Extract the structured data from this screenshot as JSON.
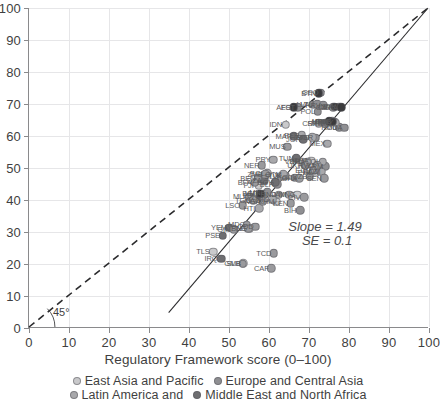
{
  "chart_data": {
    "type": "scatter",
    "title": "",
    "xlabel": "Regulatory Framework score (0–100)",
    "ylabel": "",
    "xlim": [
      0,
      100
    ],
    "ylim": [
      0,
      100
    ],
    "xticks": [
      0,
      10,
      20,
      30,
      40,
      50,
      60,
      70,
      80,
      90,
      100
    ],
    "yticks": [
      0,
      10,
      20,
      30,
      40,
      50,
      60,
      70,
      80,
      90,
      100
    ],
    "grid": true,
    "legend_position": "bottom",
    "annotations": [
      {
        "name": "slope",
        "text": "Slope = 1.49",
        "x": 74,
        "y": 32
      },
      {
        "name": "se",
        "text": "SE = 0.1",
        "x": 74.5,
        "y": 27.5
      },
      {
        "name": "angle",
        "text": "45°",
        "x": 5.5,
        "y": 3.2
      }
    ],
    "reference_lines": [
      {
        "name": "identity-45-degree-line",
        "style": "dashed",
        "x0": 0,
        "y0": 0,
        "x1": 100,
        "y1": 100
      },
      {
        "name": "regression-fit-line",
        "style": "solid",
        "x0": 35,
        "y0": 4.5,
        "x1": 100,
        "y1": 100,
        "slope": 1.49
      }
    ],
    "series": [
      {
        "name": "East Asia and Pacific",
        "color": "#c9c9cb",
        "points": [
          {
            "label": "IDN",
            "x": 64.2,
            "y": 63.5
          },
          {
            "label": "THA",
            "x": 70.5,
            "y": 52.2
          },
          {
            "label": "PHL",
            "x": 71.5,
            "y": 48.5
          },
          {
            "label": "VNM",
            "x": 68.4,
            "y": 52.0
          },
          {
            "label": "MNG",
            "x": 67.0,
            "y": 41.6
          },
          {
            "label": "KHM",
            "x": 61.8,
            "y": 39.4
          },
          {
            "label": "LAO",
            "x": 58.6,
            "y": 40.0
          },
          {
            "label": "FJI",
            "x": 57.4,
            "y": 44.4
          },
          {
            "label": "PNG",
            "x": 55.0,
            "y": 31.0
          },
          {
            "label": "SLB",
            "x": 53.6,
            "y": 20.3
          },
          {
            "label": "TLS",
            "x": 46.0,
            "y": 23.8
          },
          {
            "label": "VUT",
            "x": 58.2,
            "y": 42.0
          }
        ]
      },
      {
        "name": "Europe and Central Asia",
        "color": "#8f8f92",
        "points": [
          {
            "label": "EST",
            "x": 67.2,
            "y": 69.0
          },
          {
            "label": "GEO",
            "x": 72.8,
            "y": 73.5
          },
          {
            "label": "LVA",
            "x": 71.0,
            "y": 69.8
          },
          {
            "label": "LTU",
            "x": 72.0,
            "y": 70.0
          },
          {
            "label": "HRV",
            "x": 73.5,
            "y": 69.6
          },
          {
            "label": "SVK",
            "x": 77.5,
            "y": 69.2
          },
          {
            "label": "CZE",
            "x": 76.0,
            "y": 69.0
          },
          {
            "label": "POL",
            "x": 72.2,
            "y": 67.6
          },
          {
            "label": "SRB",
            "x": 74.0,
            "y": 64.0
          },
          {
            "label": "MKD",
            "x": 75.2,
            "y": 64.2
          },
          {
            "label": "ALB",
            "x": 76.4,
            "y": 64.4
          },
          {
            "label": "ROU",
            "x": 77.6,
            "y": 62.8
          },
          {
            "label": "MDA",
            "x": 78.8,
            "y": 62.6
          },
          {
            "label": "BGR",
            "x": 71.5,
            "y": 59.4
          },
          {
            "label": "ARM",
            "x": 74.0,
            "y": 50.6
          },
          {
            "label": "KAZ",
            "x": 72.8,
            "y": 49.0
          },
          {
            "label": "UZB",
            "x": 70.2,
            "y": 47.3
          },
          {
            "label": "KGZ",
            "x": 66.4,
            "y": 47.0
          },
          {
            "label": "TJK",
            "x": 64.0,
            "y": 47.6
          },
          {
            "label": "BIH",
            "x": 67.8,
            "y": 36.8
          },
          {
            "label": "UKR",
            "x": 69.0,
            "y": 50.8
          },
          {
            "label": "BLR",
            "x": 62.0,
            "y": 45.0
          },
          {
            "label": "MNE",
            "x": 59.6,
            "y": 42.4
          }
        ]
      },
      {
        "name": "Latin America and the Caribbean",
        "color": "#a8a8ab",
        "points": [
          {
            "label": "CRI",
            "x": 72.4,
            "y": 64.0
          },
          {
            "label": "CHL",
            "x": 75.8,
            "y": 64.6
          },
          {
            "label": "URY",
            "x": 76.6,
            "y": 64.2
          },
          {
            "label": "PER",
            "x": 68.2,
            "y": 60.2
          },
          {
            "label": "TTO",
            "x": 70.8,
            "y": 59.6
          },
          {
            "label": "MEX",
            "x": 74.6,
            "y": 57.6
          },
          {
            "label": "COL",
            "x": 73.4,
            "y": 52.0
          },
          {
            "label": "BRA",
            "x": 69.6,
            "y": 52.0
          },
          {
            "label": "ECU",
            "x": 71.0,
            "y": 49.2
          },
          {
            "label": "DOM",
            "x": 73.2,
            "y": 48.8
          },
          {
            "label": "PRY",
            "x": 61.0,
            "y": 52.6
          },
          {
            "label": "BOL",
            "x": 59.6,
            "y": 48.4
          },
          {
            "label": "SLV",
            "x": 63.0,
            "y": 47.5
          },
          {
            "label": "GTM",
            "x": 63.6,
            "y": 48.0
          },
          {
            "label": "HND",
            "x": 62.4,
            "y": 41.6
          },
          {
            "label": "NIC",
            "x": 60.8,
            "y": 40.2
          },
          {
            "label": "HTI",
            "x": 57.6,
            "y": 37.4
          },
          {
            "label": "JAM",
            "x": 65.0,
            "y": 41.6
          }
        ]
      },
      {
        "name": "Middle East and North Africa",
        "color": "#6e6e71",
        "points": [
          {
            "label": "MAR",
            "x": 66.2,
            "y": 60.0
          },
          {
            "label": "JOR",
            "x": 68.6,
            "y": 59.0
          },
          {
            "label": "TUN",
            "x": 66.8,
            "y": 53.0
          },
          {
            "label": "EGY",
            "x": 61.6,
            "y": 45.6
          },
          {
            "label": "DZA",
            "x": 58.8,
            "y": 46.2
          },
          {
            "label": "LBN",
            "x": 57.8,
            "y": 41.4
          },
          {
            "label": "IRQ",
            "x": 48.0,
            "y": 21.6
          },
          {
            "label": "PSE",
            "x": 48.4,
            "y": 28.8
          },
          {
            "label": "YEM",
            "x": 50.0,
            "y": 31.4
          }
        ]
      },
      {
        "name": "Sub-Saharan Africa",
        "color": "#9a9a9d",
        "points": [
          {
            "label": "MUS",
            "x": 64.6,
            "y": 56.6
          },
          {
            "label": "RWA",
            "x": 72.0,
            "y": 50.8
          },
          {
            "label": "SEN",
            "x": 73.8,
            "y": 46.8
          },
          {
            "label": "GHA",
            "x": 67.6,
            "y": 46.8
          },
          {
            "label": "CIV",
            "x": 68.8,
            "y": 40.8
          },
          {
            "label": "KEN",
            "x": 65.4,
            "y": 39.0
          },
          {
            "label": "NER",
            "x": 58.2,
            "y": 50.8
          },
          {
            "label": "BEN",
            "x": 57.2,
            "y": 46.8
          },
          {
            "label": "BFA",
            "x": 56.4,
            "y": 45.4
          },
          {
            "label": "MLI",
            "x": 55.0,
            "y": 41.0
          },
          {
            "label": "TGO",
            "x": 56.0,
            "y": 40.0
          },
          {
            "label": "LSO",
            "x": 53.4,
            "y": 38.4
          },
          {
            "label": "MDG",
            "x": 54.4,
            "y": 32.2
          },
          {
            "label": "COD",
            "x": 56.6,
            "y": 31.6
          },
          {
            "label": "GMB",
            "x": 53.4,
            "y": 20.1
          },
          {
            "label": "TCD",
            "x": 61.2,
            "y": 23.4
          },
          {
            "label": "CAF",
            "x": 60.6,
            "y": 18.6
          },
          {
            "label": "GIN",
            "x": 51.2,
            "y": 30.8
          },
          {
            "label": "SLE",
            "x": 54.8,
            "y": 31.0
          },
          {
            "label": "ZMB",
            "x": 59.0,
            "y": 48.0
          },
          {
            "label": "NGA",
            "x": 58.4,
            "y": 39.6
          }
        ]
      },
      {
        "name": "South Asia",
        "color": "#3a3a3c",
        "points": [
          {
            "label": "IND",
            "x": 76.4,
            "y": 69.2
          },
          {
            "label": "LKA",
            "x": 78.0,
            "y": 69.0
          },
          {
            "label": "NPL",
            "x": 75.0,
            "y": 64.6
          },
          {
            "label": "PAK",
            "x": 75.8,
            "y": 64.4
          },
          {
            "label": "BGD",
            "x": 57.8,
            "y": 42.0
          },
          {
            "label": "AFG",
            "x": 66.2,
            "y": 69.0
          },
          {
            "label": "BTN",
            "x": 72.4,
            "y": 73.4
          }
        ]
      }
    ]
  },
  "legend": {
    "rows": [
      [
        {
          "label": "East Asia and Pacific",
          "color": "#c9c9cb"
        },
        {
          "label": "Europe and Central Asia",
          "color": "#8f8f92"
        }
      ],
      [
        {
          "label": "Latin America and",
          "color": "#a8a8ab"
        },
        {
          "label": "Middle East and North Africa",
          "color": "#6e6e71"
        }
      ]
    ]
  }
}
